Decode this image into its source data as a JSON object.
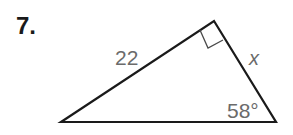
{
  "problem": {
    "number": "7."
  },
  "figure": {
    "type": "right-triangle",
    "stroke_color": "#1a1a1a",
    "label_color": "#6b6b6b",
    "labels": {
      "hypotenuse_side": "22",
      "unknown_side": "x",
      "angle": "58°"
    },
    "right_angle_marker": true
  }
}
